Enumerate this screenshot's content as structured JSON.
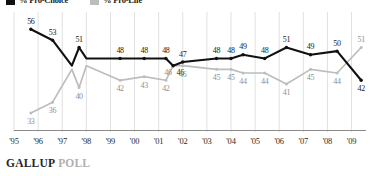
{
  "legend": {
    "items": [
      {
        "label": "% Pro-Choice",
        "color": "#111111",
        "x": 6
      },
      {
        "label": "% Pro-Life",
        "color": "#bdbdbd",
        "x": 90
      }
    ]
  },
  "footer": {
    "brand": "GALLUP",
    "brand_suffix": "POLL"
  },
  "chart_data": {
    "type": "line",
    "title": "",
    "xlabel": "",
    "ylabel": "",
    "grid": true,
    "legend_position": "top-left",
    "ylim": [
      30,
      58
    ],
    "xlim": [
      1995,
      2009.6
    ],
    "xtick_labels": [
      "'95",
      "'96",
      "'97",
      "'98",
      "'99",
      "'00",
      "'01",
      "'02",
      "'03",
      "'04",
      "'05",
      "'06",
      "'07",
      "'08",
      "'09"
    ],
    "xtick_years": [
      1995,
      1996,
      1997,
      1998,
      1999,
      2000,
      2001,
      2002,
      2003,
      2004,
      2005,
      2006,
      2007,
      2008,
      2009
    ],
    "series": [
      {
        "name": "% Pro-Choice",
        "color": "#111111",
        "x": [
          1995.7,
          1996.6,
          1997.4,
          1997.7,
          1998.0,
          1999.4,
          2000.4,
          2001.3,
          2001.6,
          2002.0,
          2003.4,
          2004.0,
          2004.5,
          2005.4,
          2006.3,
          2007.3,
          2008.4,
          2009.4
        ],
        "values": [
          56,
          53,
          46,
          51,
          48,
          48,
          48,
          48,
          46,
          47,
          48,
          48,
          49,
          48,
          51,
          49,
          50,
          42
        ],
        "labels": [
          "56",
          "53",
          "",
          "51",
          "",
          "48",
          "48",
          "48",
          "46",
          "47",
          "48",
          "48",
          "49",
          "48",
          "51",
          "49",
          "50",
          "42"
        ],
        "label_pos": [
          "above",
          "above",
          "",
          "above",
          "",
          "above",
          "above",
          "above",
          "below-right",
          "above",
          "above",
          "above",
          "above",
          "above",
          "above",
          "above",
          "above",
          "below"
        ]
      },
      {
        "name": "% Pro-Life",
        "color": "#bdbdbd",
        "x": [
          1995.7,
          1996.6,
          1997.4,
          1997.7,
          1998.0,
          1999.4,
          2000.4,
          2001.3,
          2001.6,
          2002.0,
          2003.4,
          2004.0,
          2004.5,
          2005.4,
          2006.3,
          2007.3,
          2008.4,
          2009.4
        ],
        "values": [
          33,
          36,
          45,
          40,
          46,
          42,
          43,
          42,
          46,
          46,
          45,
          45,
          44,
          44,
          41,
          45,
          44,
          51
        ],
        "labels": [
          "33",
          "36",
          "",
          "40",
          "",
          "42",
          "43",
          "42",
          "46",
          "46",
          "45",
          "45",
          "44",
          "44",
          "41",
          "45",
          "44",
          "51"
        ],
        "label_pos": [
          "below",
          "below",
          "",
          "below",
          "",
          "below",
          "below",
          "below",
          "above-left",
          "below",
          "below",
          "below",
          "below",
          "below",
          "below",
          "below",
          "below",
          "above"
        ]
      }
    ]
  }
}
